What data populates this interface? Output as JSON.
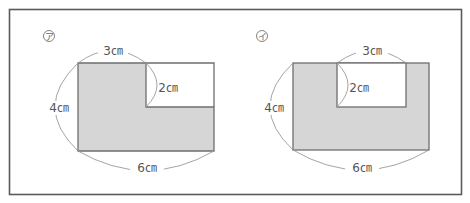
{
  "figures": [
    {
      "id": "a",
      "marker": "ア",
      "description": "L-shaped figure: 6cm by 4cm rectangle with a 3cm by 2cm rectangle removed from the top-right corner",
      "labels": {
        "top": "3㎝",
        "notch": "2㎝",
        "left": "4㎝",
        "bottom": "6㎝"
      }
    },
    {
      "id": "i",
      "marker": "イ",
      "description": "6cm by 4cm rectangle with a 3cm by 2cm rectangle removed from the top middle",
      "labels": {
        "top": "3㎝",
        "notch": "2㎝",
        "left": "4㎝",
        "bottom": "6㎝"
      }
    }
  ],
  "colors": {
    "fill": "#d6d6d6",
    "stroke": "#6e6e6e",
    "arc": "#9a9a9a",
    "frame": "#5a5a5a"
  }
}
